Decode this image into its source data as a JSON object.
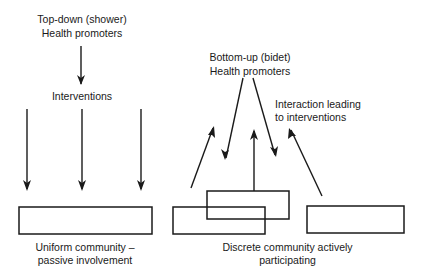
{
  "top_down": {
    "title": "Top-down (shower)",
    "promoters": "Health promoters",
    "interventions": "Interventions",
    "community_line1": "Uniform community –",
    "community_line2": "passive involvement"
  },
  "bottom_up": {
    "title": "Bottom-up (bidet)",
    "promoters": "Health promoters",
    "interaction_line1": "Interaction leading",
    "interaction_line2": "to interventions",
    "community_line1": "Discrete community actively",
    "community_line2": "participating"
  },
  "colors": {
    "line": "#1a1a1a",
    "background": "#ffffff"
  }
}
